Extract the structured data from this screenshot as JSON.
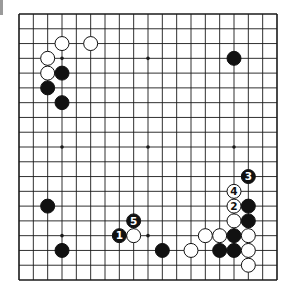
{
  "diagram": {
    "type": "go-board",
    "size": 19,
    "colors": {
      "line": "#1a1a1a",
      "black": "#111111",
      "white": "#ffffff",
      "background": "#ffffff"
    },
    "star_points": [
      [
        3,
        3
      ],
      [
        9,
        3
      ],
      [
        15,
        3
      ],
      [
        3,
        9
      ],
      [
        9,
        9
      ],
      [
        15,
        9
      ],
      [
        3,
        15
      ],
      [
        9,
        15
      ],
      [
        15,
        15
      ]
    ],
    "stones": [
      {
        "col": 3,
        "row": 2,
        "color": "white"
      },
      {
        "col": 5,
        "row": 2,
        "color": "white"
      },
      {
        "col": 2,
        "row": 3,
        "color": "white"
      },
      {
        "col": 2,
        "row": 4,
        "color": "white"
      },
      {
        "col": 3,
        "row": 4,
        "color": "black"
      },
      {
        "col": 2,
        "row": 5,
        "color": "black"
      },
      {
        "col": 3,
        "row": 6,
        "color": "black"
      },
      {
        "col": 15,
        "row": 3,
        "color": "black"
      },
      {
        "col": 2,
        "row": 13,
        "color": "black"
      },
      {
        "col": 3,
        "row": 16,
        "color": "black"
      },
      {
        "col": 10,
        "row": 16,
        "color": "black"
      },
      {
        "col": 16,
        "row": 13,
        "color": "black"
      },
      {
        "col": 15,
        "row": 14,
        "color": "white"
      },
      {
        "col": 16,
        "row": 14,
        "color": "black"
      },
      {
        "col": 13,
        "row": 15,
        "color": "white"
      },
      {
        "col": 14,
        "row": 15,
        "color": "white"
      },
      {
        "col": 15,
        "row": 15,
        "color": "black"
      },
      {
        "col": 16,
        "row": 15,
        "color": "white"
      },
      {
        "col": 12,
        "row": 16,
        "color": "white"
      },
      {
        "col": 14,
        "row": 16,
        "color": "black"
      },
      {
        "col": 15,
        "row": 16,
        "color": "black"
      },
      {
        "col": 16,
        "row": 16,
        "color": "white"
      },
      {
        "col": 16,
        "row": 17,
        "color": "white"
      },
      {
        "col": 8,
        "row": 15,
        "color": "white"
      }
    ],
    "moves": [
      {
        "number": "1",
        "col": 7,
        "row": 15,
        "color": "black"
      },
      {
        "number": "2",
        "col": 15,
        "row": 13,
        "color": "white"
      },
      {
        "number": "3",
        "col": 16,
        "row": 11,
        "color": "black"
      },
      {
        "number": "4",
        "col": 15,
        "row": 12,
        "color": "white"
      },
      {
        "number": "5",
        "col": 8,
        "row": 14,
        "color": "black"
      }
    ]
  }
}
